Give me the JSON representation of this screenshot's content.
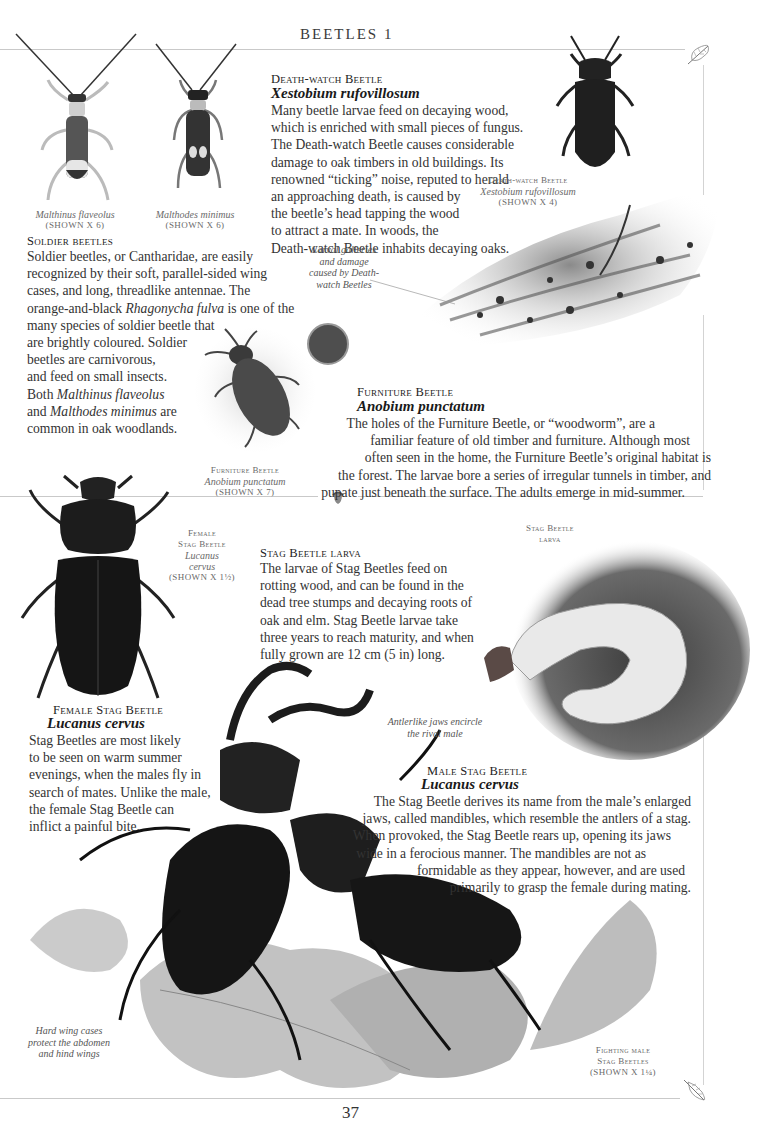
{
  "page": {
    "running_head": "BEETLES 1",
    "page_number": "37",
    "colors": {
      "paper": "#ffffff",
      "text": "#333333",
      "caption": "#6a6a6a",
      "rule": "#c9c9c9"
    }
  },
  "soldier_beetles": {
    "captions": [
      {
        "latin": "Malthinus flaveolus",
        "scale": "(SHOWN X 6)"
      },
      {
        "latin": "Malthodes minimus",
        "scale": "(SHOWN X 6)"
      }
    ],
    "heading": "Soldier beetles",
    "lines": [
      "Soldier beetles, or Cantharidae, are easily",
      "recognized by their soft, parallel-sided wing",
      "cases, and long, threadlike antennae. The",
      "orange-and-black ",
      "Rhagonycha fulva",
      " is one of the",
      "many species of soldier beetle that",
      "are brightly coloured. Soldier",
      "beetles are carnivorous,",
      "and feed on small insects.",
      "Both ",
      "Malthinus flaveolus",
      "and ",
      "Malthodes minimus",
      " are",
      "common in oak woodlands."
    ]
  },
  "death_watch": {
    "heading": "Death-watch Beetle",
    "latin": "Xestobium rufovillosum",
    "lines": [
      "Many beetle larvae feed on decaying wood,",
      "which is enriched with small pieces of fungus.",
      "The Death-watch Beetle causes considerable",
      "damage to oak timbers in old buildings. Its",
      "renowned “ticking” noise, reputed to herald",
      "an approaching death, is caused by",
      "the beetle’s head tapping the wood",
      "to attract a mate. In woods, the",
      "Death-watch Beetle inhabits decaying oaks."
    ],
    "caption": {
      "name": "Death-watch Beetle",
      "latin": "Xestobium rufovillosum",
      "scale": "(SHOWN X 4)"
    },
    "annotation": [
      "Larval galleries",
      "and damage",
      "caused by Death-",
      "watch Beetles"
    ]
  },
  "furniture_beetle": {
    "heading": "Furniture Beetle",
    "latin": "Anobium punctatum",
    "lines": [
      "The holes of the Furniture Beetle, or “woodworm”, are a",
      "familiar feature of old timber and furniture. Although most",
      "often seen in the home, the Furniture Beetle’s original habitat is",
      "the forest. The larvae bore a series of irregular tunnels in timber, and",
      "pupate just beneath the surface. The adults emerge in mid-summer."
    ],
    "caption": {
      "name": "Furniture Beetle",
      "latin": "Anobium punctatum",
      "scale": "(SHOWN X 7)"
    }
  },
  "female_stag": {
    "caption": {
      "line1": "Female",
      "line2": "Stag Beetle",
      "latin1": "Lucanus",
      "latin2": "cervus",
      "scale": "(SHOWN X 1½)"
    },
    "heading": "Female Stag Beetle",
    "latin": "Lucanus cervus",
    "lines": [
      "Stag Beetles are most likely",
      "to be seen on warm summer",
      "evenings, when the males fly in",
      "search of mates. Unlike the male,",
      "the female Stag Beetle can",
      "inflict a painful bite."
    ]
  },
  "stag_larva": {
    "heading": "Stag Beetle larva",
    "lines": [
      "The larvae of Stag Beetles feed on",
      "rotting wood, and can be found in the",
      "dead tree stumps and decaying roots of",
      "oak and elm. Stag Beetle larvae take",
      "three years to reach maturity, and when",
      "fully grown are 12 cm (5 in) long."
    ],
    "caption": {
      "line1": "Stag Beetle",
      "line2": "larva"
    }
  },
  "male_stag": {
    "heading": "Male Stag Beetle",
    "latin": "Lucanus cervus",
    "lines": [
      "The Stag Beetle derives its name from the male’s enlarged",
      "jaws, called mandibles, which resemble the antlers of a stag.",
      "When provoked, the Stag Beetle rears up, opening its jaws",
      "wide in a ferocious manner. The mandibles are not as",
      "formidable as they appear, however, and are used",
      "primarily to grasp the female during mating."
    ],
    "annotation_jaws": [
      "Antlerlike jaws encircle",
      "the rival male"
    ],
    "annotation_wings": [
      "Hard wing cases",
      "protect the abdomen",
      "and hind wings"
    ],
    "caption": {
      "line1": "Fighting male",
      "line2": "Stag Beetles",
      "scale": "(SHOWN X 1¼)"
    }
  }
}
